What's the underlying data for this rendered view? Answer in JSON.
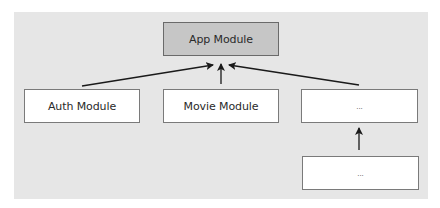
{
  "diagram": {
    "type": "module-dependency-tree",
    "root": {
      "id": "app",
      "label": "App Module"
    },
    "children": [
      {
        "id": "auth",
        "label": "Auth Module"
      },
      {
        "id": "movie",
        "label": "Movie Module"
      },
      {
        "id": "other",
        "label": "..."
      }
    ],
    "grandchildren": [
      {
        "id": "other-child",
        "label": "...",
        "parent": "other"
      }
    ],
    "edges": [
      {
        "from": "auth",
        "to": "app"
      },
      {
        "from": "movie",
        "to": "app"
      },
      {
        "from": "other",
        "to": "app"
      },
      {
        "from": "other-child",
        "to": "other"
      }
    ],
    "colors": {
      "panel": "#e6e6e6",
      "root_fill": "#c6c6c6",
      "node_fill": "#ffffff",
      "border": "#7a7a7a",
      "arrow": "#1a1a1a"
    }
  }
}
